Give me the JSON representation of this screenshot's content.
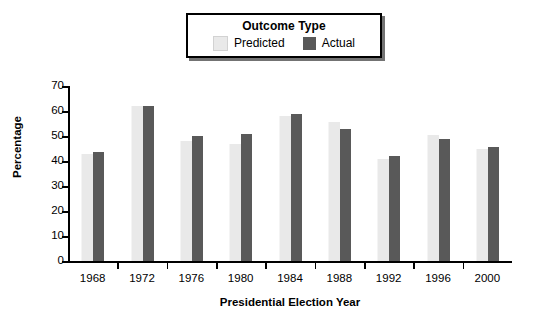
{
  "legend": {
    "title": "Outcome Type",
    "items": [
      {
        "label": "Predicted",
        "color": "#e9e9e9"
      },
      {
        "label": "Actual",
        "color": "#595959"
      }
    ]
  },
  "chart_data": {
    "type": "bar",
    "title": "",
    "xlabel": "Presidential Election Year",
    "ylabel": "Percentage",
    "categories": [
      "1968",
      "1972",
      "1976",
      "1980",
      "1984",
      "1988",
      "1992",
      "1996",
      "2000"
    ],
    "series": [
      {
        "name": "Predicted",
        "color": "#e9e9e9",
        "values": [
          43,
          62,
          48,
          47,
          58,
          55.5,
          41,
          50.5,
          45
        ]
      },
      {
        "name": "Actual",
        "color": "#595959",
        "values": [
          43.5,
          62,
          50,
          51,
          59,
          53,
          42,
          49,
          45.5
        ]
      }
    ],
    "ylim": [
      0,
      70
    ],
    "yticks": [
      0,
      10,
      20,
      30,
      40,
      50,
      60,
      70
    ],
    "grid": false,
    "legend_position": "top"
  }
}
